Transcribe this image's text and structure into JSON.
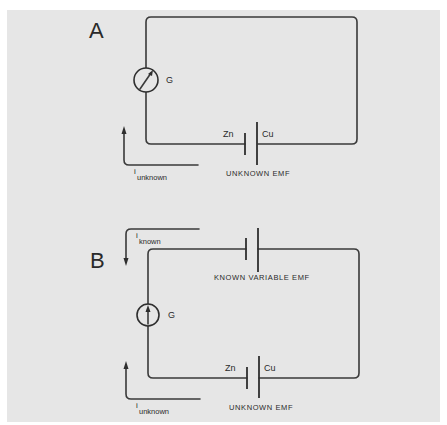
{
  "figure": {
    "background_color": "#e6e6e6",
    "line_color": "#3a3a3a"
  },
  "panel_a": {
    "letter": "A",
    "galvanometer": {
      "label": "G",
      "needle": "diagonal-deflected"
    },
    "cell": {
      "anode_label": "Zn",
      "cathode_label": "Cu",
      "caption": "UNKNOWN EMF"
    },
    "current": {
      "symbol": "i",
      "subscript": "unknown",
      "direction": "up"
    }
  },
  "panel_b": {
    "letter": "B",
    "known_cell": {
      "caption": "KNOWN VARIABLE EMF"
    },
    "galvanometer": {
      "label": "G",
      "needle": "vertical-null"
    },
    "unknown_cell": {
      "anode_label": "Zn",
      "cathode_label": "Cu",
      "caption": "UNKNOWN EMF"
    },
    "current_known": {
      "symbol": "i",
      "subscript": "known",
      "direction": "down"
    },
    "current_unknown": {
      "symbol": "i",
      "subscript": "unknown",
      "direction": "up"
    }
  }
}
